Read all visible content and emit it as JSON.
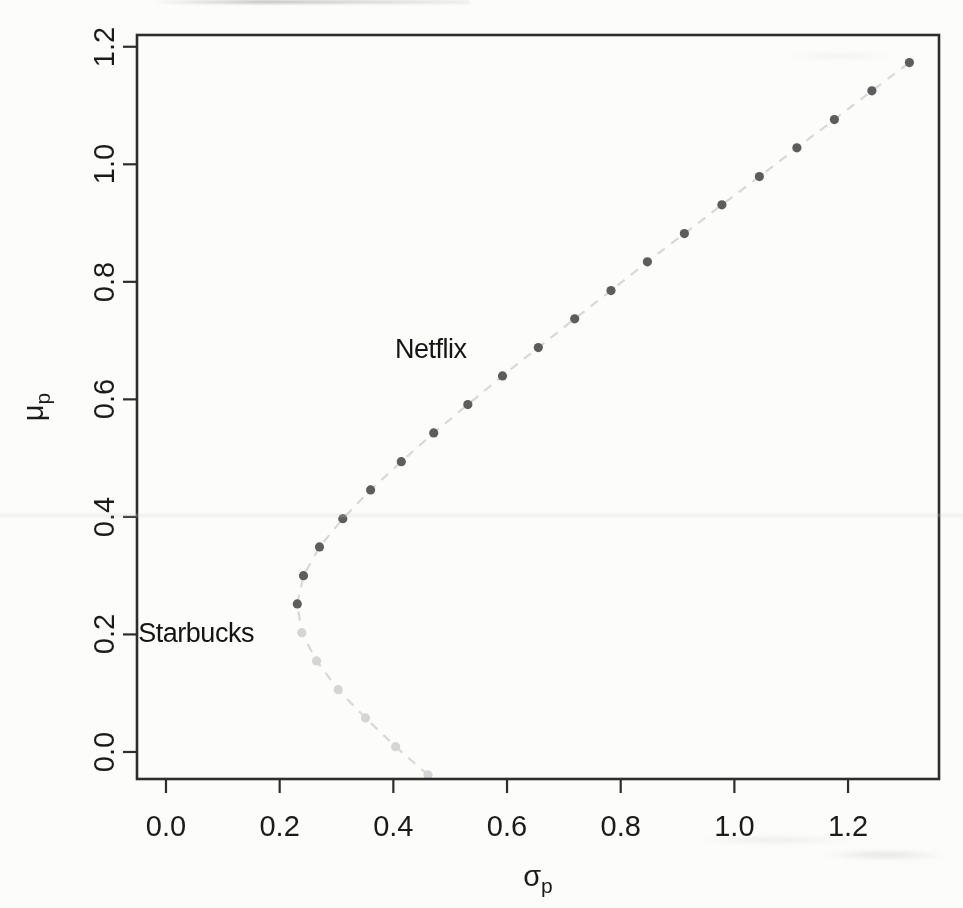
{
  "chart_data": {
    "type": "scatter",
    "title": "",
    "xlabel": "σp",
    "ylabel": "μp",
    "xlabel_symbol": "σ",
    "xlabel_sub": "p",
    "ylabel_symbol": "μ",
    "ylabel_sub": "p",
    "xlim": [
      -0.051,
      1.36
    ],
    "ylim": [
      -0.046,
      1.22
    ],
    "grid": false,
    "legend": "none",
    "x_ticks": {
      "values": [
        0.0,
        0.2,
        0.4,
        0.6,
        0.8,
        1.0,
        1.2
      ],
      "labels": [
        "0.0",
        "0.2",
        "0.4",
        "0.6",
        "0.8",
        "1.0",
        "1.2"
      ]
    },
    "y_ticks": {
      "values": [
        0.0,
        0.2,
        0.4,
        0.6,
        0.8,
        1.0,
        1.2
      ],
      "labels": [
        "0.0",
        "0.2",
        "0.4",
        "0.6",
        "0.8",
        "1.0",
        "1.2"
      ]
    },
    "frame_color": "#2d2d2d",
    "connector_line": {
      "color": "#d8d8d8",
      "dash": [
        9,
        8
      ],
      "width": 2.2
    },
    "point_radius": 4.6,
    "series": [
      {
        "name": "inefficient lower branch",
        "color": "#d5d5d5",
        "points": [
          [
            0.461,
            -0.039
          ],
          [
            0.404,
            0.009
          ],
          [
            0.351,
            0.058
          ],
          [
            0.303,
            0.106
          ],
          [
            0.265,
            0.155
          ],
          [
            0.239,
            0.203
          ]
        ]
      },
      {
        "name": "efficient upper branch",
        "color": "#5d5d5d",
        "points": [
          [
            0.231,
            0.252
          ],
          [
            0.242,
            0.3
          ],
          [
            0.27,
            0.349
          ],
          [
            0.311,
            0.397
          ],
          [
            0.36,
            0.446
          ],
          [
            0.414,
            0.494
          ],
          [
            0.471,
            0.543
          ],
          [
            0.531,
            0.591
          ],
          [
            0.592,
            0.64
          ],
          [
            0.655,
            0.688
          ],
          [
            0.719,
            0.737
          ],
          [
            0.783,
            0.785
          ],
          [
            0.847,
            0.834
          ],
          [
            0.912,
            0.882
          ],
          [
            0.978,
            0.931
          ],
          [
            1.044,
            0.979
          ],
          [
            1.11,
            1.028
          ],
          [
            1.176,
            1.076
          ],
          [
            1.242,
            1.125
          ],
          [
            1.308,
            1.173
          ]
        ]
      }
    ],
    "annotations": [
      {
        "label": "Netflix",
        "sigma": 0.466,
        "mu": 0.686
      },
      {
        "label": "Starbucks",
        "sigma": 0.053,
        "mu": 0.203
      }
    ]
  }
}
